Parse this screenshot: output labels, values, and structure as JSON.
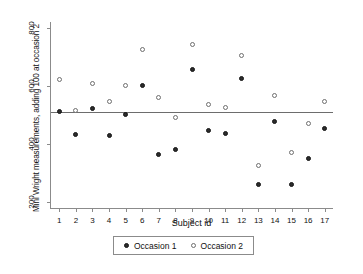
{
  "chart_data": {
    "type": "scatter",
    "title": "",
    "xlabel": "Subject id",
    "ylabel": "Mini Wright measurements, adding 100 at occasion 2",
    "xlim": [
      0.5,
      17.5
    ],
    "ylim": [
      180,
      820
    ],
    "yticks": [
      200,
      400,
      600,
      800
    ],
    "xticks": [
      1,
      2,
      3,
      4,
      5,
      6,
      7,
      8,
      9,
      10,
      11,
      12,
      13,
      14,
      15,
      16,
      17
    ],
    "grid": false,
    "legend_position": "bottom-center",
    "categories": [
      1,
      2,
      3,
      4,
      5,
      6,
      7,
      8,
      9,
      10,
      11,
      12,
      13,
      14,
      15,
      16,
      17
    ],
    "reference_line": {
      "orientation": "horizontal",
      "value": 512,
      "color": "#6d6d6d"
    },
    "series": [
      {
        "name": "Occasion 1",
        "marker": "filled-circle",
        "color": "#2b2b2b",
        "values": [
          512,
          432,
          522,
          430,
          502,
          602,
          365,
          382,
          655,
          445,
          435,
          627,
          262,
          478,
          262,
          352,
          455
        ]
      },
      {
        "name": "Occasion 2",
        "marker": "open-circle",
        "color": "#ffffff",
        "edge_color": "#6e6e6e",
        "values": [
          622,
          515,
          608,
          545,
          600,
          725,
          560,
          492,
          742,
          535,
          525,
          705,
          325,
          568,
          372,
          470,
          545
        ]
      }
    ]
  },
  "legend": {
    "items": [
      {
        "label": "Occasion 1"
      },
      {
        "label": "Occasion 2"
      }
    ]
  }
}
